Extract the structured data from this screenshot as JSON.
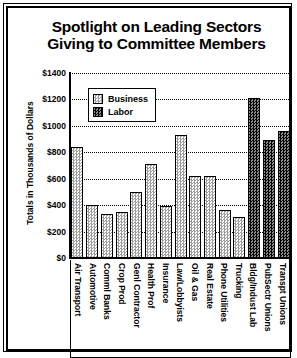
{
  "chart_data": {
    "type": "bar",
    "title": "Spotlight on Leading Sectors Giving to Committee Members",
    "title_lines": [
      "Spotlight on Leading Sectors",
      "Giving to Committee Members"
    ],
    "xlabel": "",
    "ylabel": "Totals in Thousands of Dollars",
    "ylim": [
      0,
      1400
    ],
    "ytick_labels": [
      "$1400",
      "$1200",
      "$1000",
      "$800",
      "$600",
      "$400",
      "$200",
      "$0"
    ],
    "ytick_values": [
      1400,
      1200,
      1000,
      800,
      600,
      400,
      200,
      0
    ],
    "grid": true,
    "legend_position": "upper-left-inside",
    "legend": [
      {
        "label": "Business",
        "pattern": "light-checker"
      },
      {
        "label": "Labor",
        "pattern": "dark-checker"
      }
    ],
    "categories": [
      "Air Transport",
      "Automotive",
      "Comml Banks",
      "Crop Prod",
      "Genl Contractor",
      "Health Prof",
      "Insurance",
      "Law/Lobbyists",
      "Oil & Gas",
      "Real Estate",
      "Phone Utilities",
      "Trucking",
      "Bldg/Indust Lab",
      "PubSectr Unions",
      "Transpt Unions"
    ],
    "values": [
      840,
      400,
      330,
      350,
      500,
      710,
      390,
      930,
      620,
      620,
      360,
      310,
      1210,
      890,
      960
    ],
    "series_of_bar": [
      "Business",
      "Business",
      "Business",
      "Business",
      "Business",
      "Business",
      "Business",
      "Business",
      "Business",
      "Business",
      "Business",
      "Business",
      "Labor",
      "Labor",
      "Labor"
    ]
  }
}
